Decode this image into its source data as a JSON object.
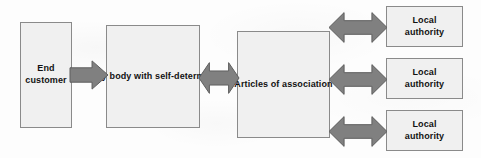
{
  "diagram": {
    "background_color": "#fdfdfd",
    "node_fill": "#f0f0f0",
    "node_border": "#8a8a8a",
    "arrow_fill": "#808080",
    "arrow_border": "#5e5e5e",
    "text_color": "#121212",
    "nodes": [
      {
        "id": "end-customer",
        "label": "End\ncustomer",
        "x": 20,
        "y": 22,
        "w": 52,
        "h": 106
      },
      {
        "id": "delivery-body",
        "label": "Delivery\nbody with\nself-determination",
        "x": 106,
        "y": 25,
        "w": 94,
        "h": 103
      },
      {
        "id": "articles",
        "label": "Articles of\nassociation",
        "x": 237,
        "y": 31,
        "w": 93,
        "h": 107
      },
      {
        "id": "local-authority-1",
        "label": "Local\nauthority",
        "x": 386,
        "y": 6,
        "w": 77,
        "h": 41
      },
      {
        "id": "local-authority-2",
        "label": "Local\nauthority",
        "x": 386,
        "y": 58,
        "w": 77,
        "h": 41
      },
      {
        "id": "local-authority-3",
        "label": "Local\nauthority",
        "x": 386,
        "y": 110,
        "w": 77,
        "h": 41
      }
    ],
    "arrows": [
      {
        "id": "arrow-customer-to-delivery",
        "kind": "single-right",
        "x": 70,
        "y": 60,
        "w": 38,
        "h": 30
      },
      {
        "id": "arrow-delivery-to-articles",
        "kind": "double",
        "x": 199,
        "y": 62,
        "w": 40,
        "h": 32
      },
      {
        "id": "arrow-articles-to-authority-1",
        "kind": "double",
        "x": 329,
        "y": 12,
        "w": 58,
        "h": 31
      },
      {
        "id": "arrow-articles-to-authority-2",
        "kind": "double",
        "x": 329,
        "y": 64,
        "w": 58,
        "h": 31
      },
      {
        "id": "arrow-articles-to-authority-3",
        "kind": "double",
        "x": 329,
        "y": 116,
        "w": 58,
        "h": 31
      }
    ]
  }
}
